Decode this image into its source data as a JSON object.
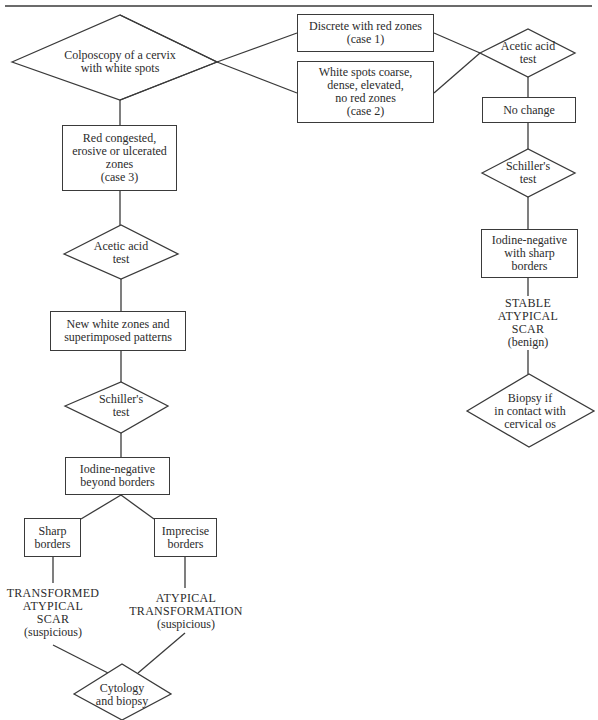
{
  "diagram": {
    "title": "",
    "nodes": {
      "start": {
        "shape": "diamond",
        "label": "Colposcopy of a cervix\nwith white spots"
      },
      "case1": {
        "shape": "box",
        "label": "Discrete with red zones\n(case 1)"
      },
      "case2": {
        "shape": "box",
        "label": "White spots coarse,\ndense, elevated,\nno red zones\n(case 2)"
      },
      "acetic_right": {
        "shape": "diamond",
        "label": "Acetic acid\ntest"
      },
      "no_change": {
        "shape": "box",
        "label": "No change"
      },
      "schiller_right": {
        "shape": "diamond",
        "label": "Schiller's\ntest"
      },
      "iodine_sharp": {
        "shape": "box",
        "label": "Iodine-negative\nwith sharp\nborders"
      },
      "stable_scar": {
        "shape": "text",
        "label": "STABLE\nATYPICAL\nSCAR",
        "note": "(benign)"
      },
      "biopsy_if": {
        "shape": "diamond",
        "label": "Biopsy if\nin contact with\ncervical os"
      },
      "case3": {
        "shape": "box",
        "label": "Red congested,\nerosive or ulcerated\nzones\n(case 3)"
      },
      "acetic_left": {
        "shape": "diamond",
        "label": "Acetic acid\ntest"
      },
      "new_white": {
        "shape": "box",
        "label": "New white zones and\nsuperimposed patterns"
      },
      "schiller_left": {
        "shape": "diamond",
        "label": "Schiller's\ntest"
      },
      "iodine_beyond": {
        "shape": "box",
        "label": "Iodine-negative\nbeyond borders"
      },
      "sharp_borders": {
        "shape": "box",
        "label": "Sharp\nborders"
      },
      "imprecise_borders": {
        "shape": "box",
        "label": "Imprecise\nborders"
      },
      "transformed_scar": {
        "shape": "text",
        "label": "TRANSFORMED\nATYPICAL\nSCAR",
        "note": "(suspicious)"
      },
      "atypical_transformation": {
        "shape": "text",
        "label": "ATYPICAL\nTRANSFORMATION",
        "note": "(suspicious)"
      },
      "cytology_biopsy": {
        "shape": "diamond",
        "label": "Cytology\nand biopsy"
      }
    },
    "edges": [
      [
        "start",
        "case1"
      ],
      [
        "start",
        "case2"
      ],
      [
        "start",
        "case3"
      ],
      [
        "case1",
        "acetic_right"
      ],
      [
        "case2",
        "acetic_right"
      ],
      [
        "acetic_right",
        "no_change"
      ],
      [
        "no_change",
        "schiller_right"
      ],
      [
        "schiller_right",
        "iodine_sharp"
      ],
      [
        "iodine_sharp",
        "stable_scar"
      ],
      [
        "stable_scar",
        "biopsy_if"
      ],
      [
        "case3",
        "acetic_left"
      ],
      [
        "acetic_left",
        "new_white"
      ],
      [
        "new_white",
        "schiller_left"
      ],
      [
        "schiller_left",
        "iodine_beyond"
      ],
      [
        "iodine_beyond",
        "sharp_borders"
      ],
      [
        "iodine_beyond",
        "imprecise_borders"
      ],
      [
        "sharp_borders",
        "transformed_scar"
      ],
      [
        "imprecise_borders",
        "atypical_transformation"
      ],
      [
        "transformed_scar",
        "cytology_biopsy"
      ],
      [
        "atypical_transformation",
        "cytology_biopsy"
      ]
    ],
    "colors": {
      "line": "#3a3a3a",
      "text": "#2b2b2b",
      "background": "#ffffff"
    }
  }
}
